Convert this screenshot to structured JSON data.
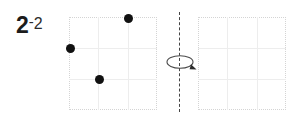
{
  "label": {
    "main": "2",
    "dash": "-",
    "sub": "2",
    "full": "2-2"
  },
  "colors": {
    "dot": "#111111",
    "grid_border": "#d4d4d4",
    "grid_line": "#ededed",
    "axis": "#444444",
    "background": "#ffffff",
    "label": "#1c1c1c"
  },
  "axis": {
    "name": "rotation-axis",
    "style": "dashed-vertical",
    "x": 179,
    "y_top": 12,
    "y_bottom": 112
  },
  "rotation_icon": {
    "name": "rotation-arrow-icon",
    "direction": "clockwise-around-vertical-axis",
    "cx": 180,
    "cy": 62
  },
  "grids": [
    {
      "name": "source-grid",
      "x": 69,
      "y": 17,
      "width": 88,
      "height": 93,
      "cols": 3,
      "rows": 3,
      "dots": [
        {
          "col": 2,
          "row": 0,
          "cx": 128,
          "cy": 18
        },
        {
          "col": 0,
          "row": 1,
          "cx": 70,
          "cy": 48
        },
        {
          "col": 1,
          "row": 2,
          "cx": 99,
          "cy": 79
        }
      ]
    },
    {
      "name": "target-grid",
      "x": 198,
      "y": 17,
      "width": 88,
      "height": 93,
      "cols": 3,
      "rows": 3,
      "dots": []
    }
  ]
}
